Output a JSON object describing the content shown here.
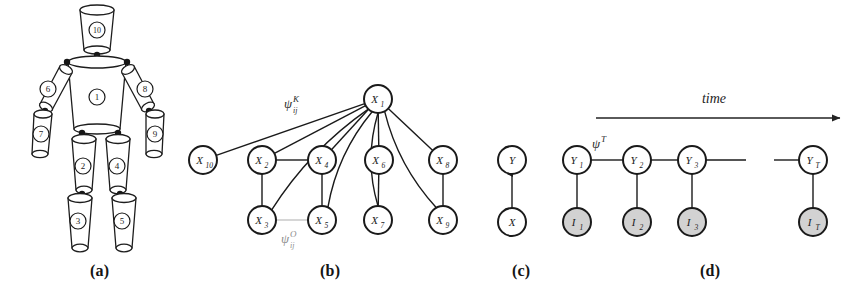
{
  "figure": {
    "width": 854,
    "height": 291,
    "background": "#ffffff",
    "ink": "#1a1a1a",
    "shaded_fill": "#d2d2d2"
  },
  "panels": [
    {
      "id": "a",
      "caption": "(a)",
      "x": 90,
      "y": 262
    },
    {
      "id": "b",
      "caption": "(b)",
      "x": 320,
      "y": 262
    },
    {
      "id": "c",
      "caption": "(c)",
      "x": 512,
      "y": 262
    },
    {
      "id": "d",
      "caption": "(d)",
      "x": 700,
      "y": 262
    }
  ],
  "panel_a": {
    "description": "articulated human body model built from truncated-cone limbs",
    "parts": [
      {
        "id": "torso",
        "label": "1",
        "cx": 97,
        "cy": 97
      },
      {
        "id": "left-thigh",
        "label": "2",
        "cx": 83,
        "cy": 166
      },
      {
        "id": "left-shin",
        "label": "3",
        "cx": 78,
        "cy": 221
      },
      {
        "id": "right-thigh",
        "label": "4",
        "cx": 117,
        "cy": 166
      },
      {
        "id": "right-shin",
        "label": "5",
        "cx": 122,
        "cy": 221
      },
      {
        "id": "left-upper-arm",
        "label": "6",
        "cx": 48,
        "cy": 89
      },
      {
        "id": "left-forearm",
        "label": "7",
        "cx": 41,
        "cy": 134
      },
      {
        "id": "right-upper-arm",
        "label": "8",
        "cx": 145,
        "cy": 89
      },
      {
        "id": "right-forearm",
        "label": "9",
        "cx": 155,
        "cy": 134
      },
      {
        "id": "head",
        "label": "10",
        "cx": 97,
        "cy": 30
      }
    ]
  },
  "panel_b": {
    "description": "undirected graphical model over body part states",
    "nodes": [
      {
        "id": "X1",
        "symbol": "X",
        "sub": "1",
        "cx": 378,
        "cy": 99,
        "shaded": false
      },
      {
        "id": "X10",
        "symbol": "X",
        "sub": "10",
        "cx": 203,
        "cy": 160,
        "shaded": false
      },
      {
        "id": "X2",
        "symbol": "X",
        "sub": "2",
        "cx": 262,
        "cy": 160,
        "shaded": false
      },
      {
        "id": "X4",
        "symbol": "X",
        "sub": "4",
        "cx": 322,
        "cy": 160,
        "shaded": false
      },
      {
        "id": "X6",
        "symbol": "X",
        "sub": "6",
        "cx": 379,
        "cy": 160,
        "shaded": false
      },
      {
        "id": "X8",
        "symbol": "X",
        "sub": "8",
        "cx": 443,
        "cy": 160,
        "shaded": false
      },
      {
        "id": "X3",
        "symbol": "X",
        "sub": "3",
        "cx": 262,
        "cy": 220,
        "shaded": false
      },
      {
        "id": "X5",
        "symbol": "X",
        "sub": "5",
        "cx": 322,
        "cy": 220,
        "shaded": false
      },
      {
        "id": "X7",
        "symbol": "X",
        "sub": "7",
        "cx": 378,
        "cy": 220,
        "shaded": false
      },
      {
        "id": "X9",
        "symbol": "X",
        "sub": "9",
        "cx": 443,
        "cy": 220,
        "shaded": false
      }
    ],
    "edges": [
      {
        "from": "X1",
        "to": "X10",
        "style": "solid"
      },
      {
        "from": "X1",
        "to": "X2",
        "style": "solid"
      },
      {
        "from": "X1",
        "to": "X4",
        "style": "solid"
      },
      {
        "from": "X1",
        "to": "X6",
        "style": "solid"
      },
      {
        "from": "X1",
        "to": "X8",
        "style": "solid"
      },
      {
        "from": "X1",
        "to": "X3",
        "style": "curved"
      },
      {
        "from": "X1",
        "to": "X5",
        "style": "curved"
      },
      {
        "from": "X1",
        "to": "X7",
        "style": "curved"
      },
      {
        "from": "X1",
        "to": "X9",
        "style": "curved"
      },
      {
        "from": "X2",
        "to": "X4",
        "style": "solid"
      },
      {
        "from": "X2",
        "to": "X3",
        "style": "solid"
      },
      {
        "from": "X4",
        "to": "X5",
        "style": "solid"
      },
      {
        "from": "X6",
        "to": "X7",
        "style": "solid"
      },
      {
        "from": "X8",
        "to": "X9",
        "style": "solid"
      },
      {
        "from": "X3",
        "to": "X5",
        "style": "faint"
      }
    ],
    "annotations": [
      {
        "id": "psi-kinematic",
        "base": "ψ",
        "sup": "K",
        "sub": "ij",
        "x": 284,
        "y": 108,
        "faint": false
      },
      {
        "id": "psi-occlusion",
        "base": "ψ",
        "sup": "O",
        "sub": "ij",
        "x": 281,
        "y": 243,
        "faint": true
      }
    ]
  },
  "panel_c": {
    "description": "single directed link from observation X to state Y",
    "nodes": [
      {
        "id": "Y",
        "symbol": "Y",
        "sub": "",
        "cx": 512,
        "cy": 160,
        "shaded": false
      },
      {
        "id": "X",
        "symbol": "X",
        "sub": "",
        "cx": 512,
        "cy": 222,
        "shaded": false
      }
    ],
    "edges": [
      {
        "from": "X",
        "to": "Y",
        "style": "arrow"
      }
    ]
  },
  "panel_d": {
    "description": "temporal chain of states Y with shaded image evidence I",
    "time_axis": {
      "label": "time",
      "label_x": 714,
      "label_y": 103,
      "line_x1": 596,
      "line_x2": 840,
      "line_y": 118
    },
    "nodes": [
      {
        "id": "Y1",
        "symbol": "Y",
        "sub": "1",
        "cx": 577,
        "cy": 160,
        "shaded": false
      },
      {
        "id": "Y2",
        "symbol": "Y",
        "sub": "2",
        "cx": 637,
        "cy": 160,
        "shaded": false
      },
      {
        "id": "Y3",
        "symbol": "Y",
        "sub": "3",
        "cx": 692,
        "cy": 160,
        "shaded": false
      },
      {
        "id": "YT",
        "symbol": "Y",
        "sub": "T",
        "cx": 813,
        "cy": 160,
        "shaded": false
      },
      {
        "id": "I1",
        "symbol": "I",
        "sub": "1",
        "cx": 577,
        "cy": 222,
        "shaded": true
      },
      {
        "id": "I2",
        "symbol": "I",
        "sub": "2",
        "cx": 637,
        "cy": 222,
        "shaded": true
      },
      {
        "id": "I3",
        "symbol": "I",
        "sub": "3",
        "cx": 692,
        "cy": 222,
        "shaded": true
      },
      {
        "id": "IT",
        "symbol": "I",
        "sub": "T",
        "cx": 813,
        "cy": 222,
        "shaded": true
      }
    ],
    "edges": [
      {
        "from": "Y1",
        "to": "Y2",
        "style": "solid"
      },
      {
        "from": "Y2",
        "to": "Y3",
        "style": "solid"
      },
      {
        "from": "Y1",
        "to": "I1",
        "style": "solid"
      },
      {
        "from": "Y2",
        "to": "I2",
        "style": "solid"
      },
      {
        "from": "Y3",
        "to": "I3",
        "style": "solid"
      },
      {
        "from": "YT",
        "to": "IT",
        "style": "solid"
      }
    ],
    "dangling_edges": [
      {
        "id": "chain-right-stub",
        "x1": 704,
        "x2": 746,
        "y": 160
      },
      {
        "id": "chain-left-stub",
        "x1": 774,
        "x2": 801,
        "y": 160
      }
    ],
    "annotations": [
      {
        "id": "psi-temporal",
        "base": "ψ",
        "sup": "T",
        "sub": "",
        "x": 592,
        "y": 148,
        "faint": false
      }
    ]
  }
}
